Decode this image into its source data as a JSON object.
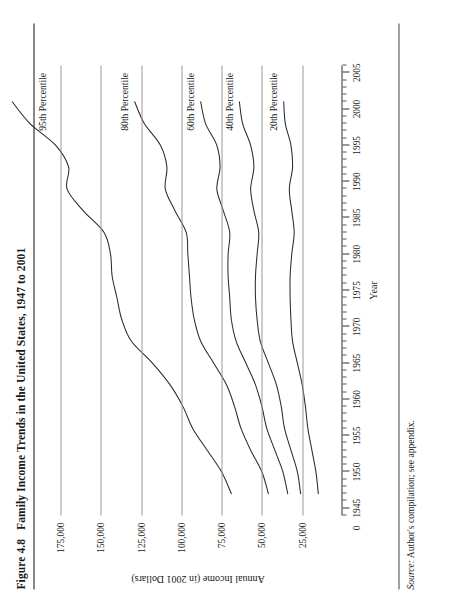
{
  "figure": {
    "number": "Figure 4.8",
    "title": "Family Income Trends in the United States, 1947 to 2001",
    "source_prefix": "Source:",
    "source_text": " Author's compilation; see appendix."
  },
  "chart_data": {
    "type": "line",
    "title": "Family Income Trends in the United States, 1947 to 2001",
    "xlabel": "Year",
    "ylabel": "Annual Income (in 2001 Dollars)",
    "xlim": [
      1944,
      2006
    ],
    "ylim": [
      0,
      180000
    ],
    "xticks": [
      1945,
      1950,
      1955,
      1960,
      1965,
      1970,
      1975,
      1980,
      1985,
      1990,
      1995,
      2000,
      2005
    ],
    "xtick_labels": [
      "1945",
      "1950",
      "1955",
      "1960",
      "1965",
      "1970",
      "1975",
      "1980",
      "1985",
      "1990",
      "1995",
      "2000",
      "2005"
    ],
    "x_minor_tick_step": 1,
    "yticks": [
      0,
      25000,
      50000,
      75000,
      100000,
      125000,
      150000,
      175000
    ],
    "ytick_labels": [
      "0",
      "25,000",
      "50,000",
      "75,000",
      "100,000",
      "125,000",
      "150,000",
      "175,000"
    ],
    "grid": "horizontal-only",
    "legend": "inline-series-labels",
    "line_color": "#2b2b2b",
    "x": [
      1947,
      1950,
      1953,
      1956,
      1959,
      1962,
      1965,
      1968,
      1971,
      1974,
      1977,
      1980,
      1983,
      1986,
      1989,
      1992,
      1995,
      1998,
      2001
    ],
    "series": [
      {
        "name": "95th Percentile",
        "label": "95th Percentile",
        "values": [
          69000,
          75000,
          84000,
          93000,
          99000,
          107000,
          118000,
          131000,
          137000,
          140000,
          143000,
          144000,
          148000,
          161000,
          171000,
          170000,
          178000,
          194000,
          205000
        ]
      },
      {
        "name": "80th Percentile",
        "label": "80th Percentile",
        "values": [
          46000,
          50000,
          57000,
          63000,
          67000,
          72000,
          80000,
          88000,
          92000,
          94000,
          95000,
          96000,
          97000,
          104000,
          110000,
          109000,
          113000,
          123000,
          129000
        ]
      },
      {
        "name": "60th Percentile",
        "label": "60th Percentile",
        "values": [
          34000,
          37000,
          42000,
          47000,
          50000,
          54000,
          60000,
          66000,
          69000,
          70000,
          71000,
          71000,
          70000,
          74000,
          78000,
          76000,
          78000,
          85000,
          88000
        ]
      },
      {
        "name": "40th Percentile",
        "label": "40th Percentile",
        "values": [
          26000,
          28000,
          32000,
          36000,
          38000,
          41000,
          46000,
          51000,
          53000,
          54000,
          54000,
          53000,
          52000,
          55000,
          57000,
          55000,
          57000,
          62000,
          64000
        ]
      },
      {
        "name": "20th Percentile",
        "label": "20th Percentile",
        "values": [
          15000,
          16500,
          19000,
          21500,
          23000,
          25000,
          28000,
          31000,
          32000,
          32500,
          32500,
          31500,
          30000,
          31500,
          33000,
          31000,
          32000,
          35500,
          36500
        ]
      }
    ]
  }
}
